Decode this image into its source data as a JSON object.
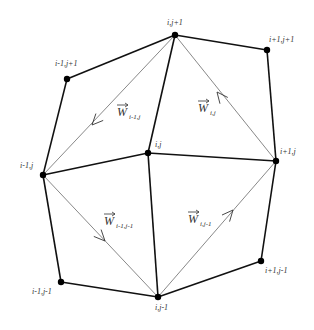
{
  "diagram": {
    "nodes": [
      {
        "id": "ij1",
        "label": "i,j+1",
        "x": 175,
        "y": 35,
        "lx": 167,
        "ly": 25
      },
      {
        "id": "i1j1",
        "label": "i+1,j+1",
        "x": 267,
        "y": 50,
        "lx": 269,
        "ly": 42
      },
      {
        "id": "im1j1",
        "label": "i-1,j+1",
        "x": 67,
        "y": 79,
        "lx": 55,
        "ly": 66
      },
      {
        "id": "ij",
        "label": "i,j",
        "x": 148,
        "y": 153,
        "lx": 155,
        "ly": 147
      },
      {
        "id": "im1j",
        "label": "i-1,j",
        "x": 43,
        "y": 175,
        "lx": 20,
        "ly": 168
      },
      {
        "id": "i1j",
        "label": "i+1,j",
        "x": 276,
        "y": 161,
        "lx": 280,
        "ly": 154
      },
      {
        "id": "im1jm1",
        "label": "i-1,j-1",
        "x": 61,
        "y": 282,
        "lx": 32,
        "ly": 294
      },
      {
        "id": "ijm1",
        "label": "i,j-1",
        "x": 158,
        "y": 297,
        "lx": 155,
        "ly": 310
      },
      {
        "id": "i1jm1",
        "label": "i+1,j-1",
        "x": 261,
        "y": 261,
        "lx": 265,
        "ly": 273
      }
    ],
    "edges": [
      [
        "im1j",
        "im1j1"
      ],
      [
        "im1j1",
        "ij1"
      ],
      [
        "ij1",
        "i1j1"
      ],
      [
        "i1j1",
        "i1j"
      ],
      [
        "i1j",
        "i1jm1"
      ],
      [
        "i1jm1",
        "ijm1"
      ],
      [
        "ijm1",
        "im1jm1"
      ],
      [
        "im1jm1",
        "im1j"
      ],
      [
        "ij1",
        "ij"
      ],
      [
        "ij",
        "ijm1"
      ],
      [
        "im1j",
        "ij"
      ],
      [
        "ij",
        "i1j"
      ]
    ],
    "diagonals": [
      [
        "ij1",
        "im1j"
      ],
      [
        "ij1",
        "i1j"
      ],
      [
        "im1j",
        "ijm1"
      ],
      [
        "ijm1",
        "i1j"
      ]
    ],
    "vectors": [
      {
        "name": "W",
        "sub": "i-1,j",
        "x": 117,
        "y": 116,
        "arrow": {
          "x": 92,
          "y": 125,
          "dir": "down-left"
        }
      },
      {
        "name": "W",
        "sub": "i,j",
        "x": 198,
        "y": 112,
        "arrow": {
          "x": 217,
          "y": 92,
          "dir": "up-left"
        }
      },
      {
        "name": "W",
        "sub": "i-1,j-1",
        "x": 104,
        "y": 225,
        "arrow": {
          "x": 105,
          "y": 241,
          "dir": "down-right"
        }
      },
      {
        "name": "W",
        "sub": "i,j-1",
        "x": 188,
        "y": 223,
        "arrow": {
          "x": 233,
          "y": 210,
          "dir": "up-right"
        }
      }
    ]
  }
}
